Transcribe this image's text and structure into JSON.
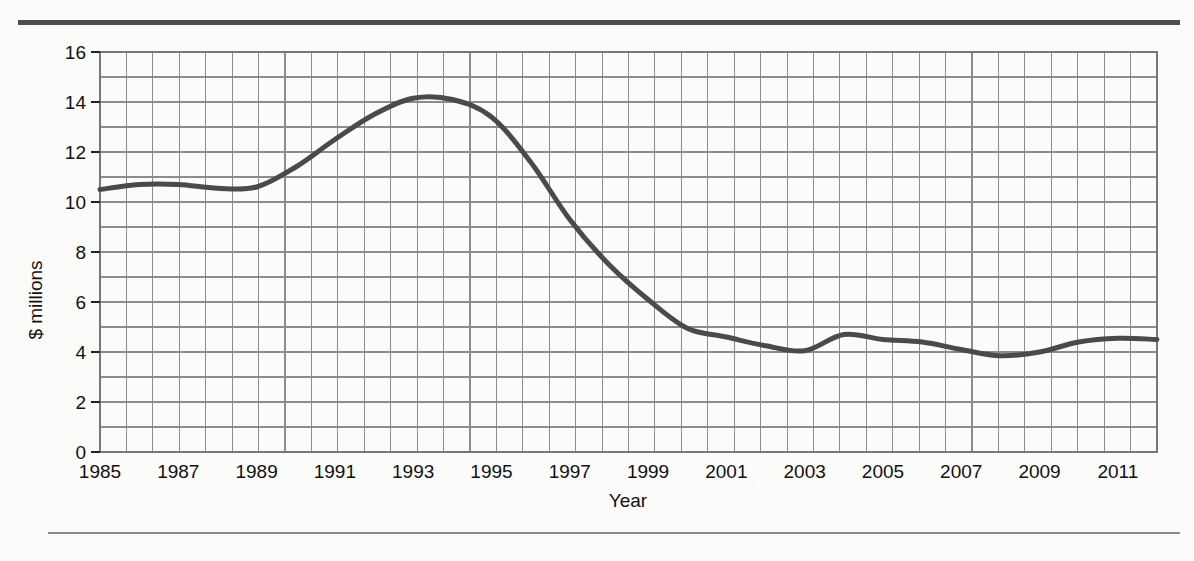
{
  "figure": {
    "background_color": "#fbfbfa",
    "rule_color_top": "#4d4d4d",
    "rule_color_bottom": "#8a8a8a"
  },
  "chart_data": {
    "type": "line",
    "title": "",
    "subtitle": "",
    "xlabel": "Year",
    "ylabel": "$ millions",
    "xlim": [
      1985,
      2012
    ],
    "ylim": [
      0,
      16
    ],
    "ytick_values": [
      0,
      2,
      4,
      6,
      8,
      10,
      12,
      14,
      16
    ],
    "ytick_labels": [
      "0",
      "2",
      "4",
      "6",
      "8",
      "10",
      "12",
      "14",
      "16"
    ],
    "y_minor_step": 1,
    "xtick_values": [
      1985,
      1987,
      1989,
      1991,
      1993,
      1995,
      1997,
      1999,
      2001,
      2003,
      2005,
      2007,
      2009,
      2011
    ],
    "xtick_labels": [
      "1985",
      "1987",
      "1989",
      "1991",
      "1993",
      "1995",
      "1997",
      "1999",
      "2001",
      "2003",
      "2005",
      "2007",
      "2009",
      "2011"
    ],
    "grid": true,
    "grid_color": "#8c8c8c",
    "legend": false,
    "legend_position": "none",
    "line_color": "#4a4a4a",
    "line_width": 5,
    "x": [
      1985,
      1986,
      1987,
      1988,
      1989,
      1990,
      1991,
      1992,
      1993,
      1994,
      1995,
      1996,
      1997,
      1998,
      1999,
      2000,
      2001,
      2002,
      2003,
      2004,
      2005,
      2006,
      2007,
      2008,
      2009,
      2010,
      2011,
      2012
    ],
    "values": [
      10.5,
      10.7,
      10.7,
      10.55,
      10.6,
      11.4,
      12.5,
      13.5,
      14.15,
      14.1,
      13.4,
      11.6,
      9.3,
      7.5,
      6.1,
      4.95,
      4.6,
      4.25,
      4.05,
      4.7,
      4.5,
      4.4,
      4.1,
      3.85,
      4.0,
      4.4,
      4.55,
      4.5
    ],
    "series": [
      {
        "name": "value",
        "values": [
          10.5,
          10.7,
          10.7,
          10.55,
          10.6,
          11.4,
          12.5,
          13.5,
          14.15,
          14.1,
          13.4,
          11.6,
          9.3,
          7.5,
          6.1,
          4.95,
          4.6,
          4.25,
          4.05,
          4.7,
          4.5,
          4.4,
          4.1,
          3.85,
          4.0,
          4.4,
          4.55,
          4.5
        ]
      }
    ],
    "annotations": []
  },
  "plot_geometry": {
    "left": 100,
    "top": 52,
    "right": 1157,
    "bottom": 452,
    "grid_cols": 40,
    "grid_rows": 16
  }
}
